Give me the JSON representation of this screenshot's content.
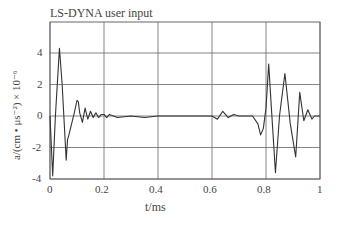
{
  "chart_data": {
    "type": "line",
    "title": "LS-DYNA user input",
    "xlabel": "t/ms",
    "ylabel": "a/(cm • μs⁻²) × 10⁻⁶",
    "xlim": [
      0,
      1
    ],
    "ylim": [
      -4,
      6
    ],
    "grid": true,
    "x_ticks": [
      "0",
      "0.2",
      "0.4",
      "0.6",
      "0.8",
      "1"
    ],
    "y_ticks": [
      "-4",
      "-2",
      "0",
      "2",
      "4"
    ],
    "series": [
      {
        "name": "acceleration",
        "x": [
          0,
          0.01,
          0.02,
          0.035,
          0.045,
          0.06,
          0.065,
          0.07,
          0.08,
          0.09,
          0.1,
          0.105,
          0.11,
          0.12,
          0.13,
          0.14,
          0.15,
          0.16,
          0.17,
          0.18,
          0.19,
          0.2,
          0.21,
          0.22,
          0.25,
          0.3,
          0.35,
          0.4,
          0.42,
          0.45,
          0.5,
          0.55,
          0.6,
          0.62,
          0.64,
          0.66,
          0.68,
          0.7,
          0.75,
          0.77,
          0.78,
          0.79,
          0.8,
          0.81,
          0.82,
          0.835,
          0.85,
          0.87,
          0.89,
          0.91,
          0.925,
          0.94,
          0.955,
          0.97,
          0.98,
          1.0
        ],
        "values": [
          0,
          -3.8,
          0,
          4.3,
          2.0,
          -2.8,
          -1.5,
          -1.2,
          -0.5,
          0.2,
          1.0,
          0.9,
          0.2,
          -0.4,
          0.5,
          -0.2,
          0.3,
          -0.1,
          0.2,
          -0.1,
          0.1,
          0.1,
          -0.1,
          0.1,
          -0.1,
          0.0,
          -0.1,
          0.0,
          0.0,
          0.0,
          0.0,
          0.0,
          0.0,
          -0.2,
          0.3,
          -0.1,
          0.1,
          0.0,
          0.0,
          -0.5,
          -1.2,
          -0.8,
          0.5,
          3.3,
          0.5,
          -3.6,
          0.0,
          2.7,
          -0.5,
          -2.6,
          1.5,
          -0.3,
          0.4,
          -0.2,
          0.0,
          0.0
        ]
      }
    ]
  }
}
